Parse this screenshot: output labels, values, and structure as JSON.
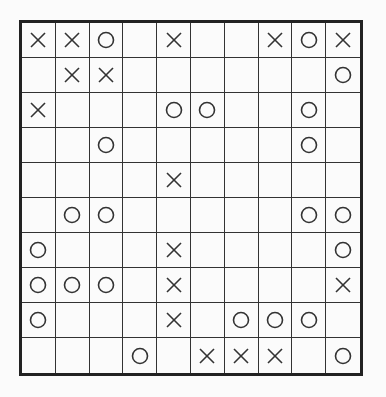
{
  "puzzle": {
    "rows": 10,
    "cols": 10,
    "legend": {
      "X": "cross-mark",
      "O": "circle-mark",
      "": "empty"
    },
    "grid": [
      [
        "X",
        "X",
        "O",
        "",
        "X",
        "",
        "",
        "X",
        "O",
        "X"
      ],
      [
        "",
        "X",
        "X",
        "",
        "",
        "",
        "",
        "",
        "",
        "O"
      ],
      [
        "X",
        "",
        "",
        "",
        "O",
        "O",
        "",
        "",
        "O",
        ""
      ],
      [
        "",
        "",
        "O",
        "",
        "",
        "",
        "",
        "",
        "O",
        ""
      ],
      [
        "",
        "",
        "",
        "",
        "X",
        "",
        "",
        "",
        "",
        ""
      ],
      [
        "",
        "O",
        "O",
        "",
        "",
        "",
        "",
        "",
        "O",
        "O"
      ],
      [
        "O",
        "",
        "",
        "",
        "X",
        "",
        "",
        "",
        "",
        "O"
      ],
      [
        "O",
        "O",
        "O",
        "",
        "X",
        "",
        "",
        "",
        "",
        "X"
      ],
      [
        "O",
        "",
        "",
        "",
        "X",
        "",
        "O",
        "O",
        "O",
        ""
      ],
      [
        "",
        "",
        "",
        "O",
        "",
        "X",
        "X",
        "X",
        "",
        "O"
      ]
    ]
  },
  "colors": {
    "line": "#333333",
    "border": "#222222",
    "background": "#fbfbfb"
  }
}
